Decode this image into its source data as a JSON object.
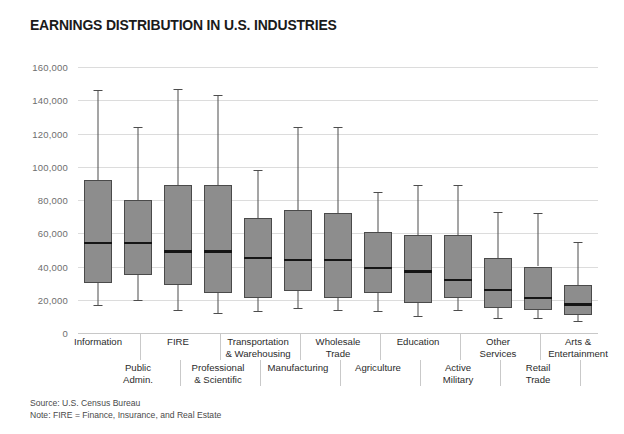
{
  "chart_data": {
    "type": "box",
    "title": "EARNINGS DISTRIBUTION IN U.S. INDUSTRIES",
    "xlabel": "",
    "ylabel": "",
    "ylim": [
      0,
      160000
    ],
    "ytick_values": [
      0,
      20000,
      40000,
      60000,
      80000,
      100000,
      120000,
      140000,
      160000
    ],
    "ytick_labels": [
      "0",
      "20,000",
      "40,000",
      "60,000",
      "80,000",
      "100,000",
      "120,000",
      "140,000",
      "160,000"
    ],
    "grid": true,
    "legend": "none",
    "categories": [
      "Information",
      "Public Admin.",
      "FIRE",
      "Professional & Scientific",
      "Manufacturing",
      "Transportation & Warehousing",
      "Wholesale Trade",
      "Agriculture",
      "Education",
      "Active Military",
      "Other Services",
      "Retail Trade",
      "Arts & Entertainment"
    ],
    "boxes": [
      {
        "category": "Information",
        "whisker_low": 17000,
        "q1": 30000,
        "median": 54000,
        "q3": 92000,
        "whisker_high": 146000
      },
      {
        "category": "Public Admin.",
        "whisker_low": 20000,
        "q1": 35000,
        "median": 54000,
        "q3": 80000,
        "whisker_high": 124000
      },
      {
        "category": "FIRE",
        "whisker_low": 14000,
        "q1": 29000,
        "median": 49000,
        "q3": 89000,
        "whisker_high": 147000
      },
      {
        "category": "Professional & Scientific",
        "whisker_low": 12000,
        "q1": 24000,
        "median": 49000,
        "q3": 89000,
        "whisker_high": 143000
      },
      {
        "category": "Transportation & Warehousing",
        "whisker_low": 13000,
        "q1": 21000,
        "median": 45000,
        "q3": 69000,
        "whisker_high": 98000
      },
      {
        "category": "Manufacturing",
        "whisker_low": 15000,
        "q1": 25000,
        "median": 44000,
        "q3": 74000,
        "whisker_high": 124000
      },
      {
        "category": "Wholesale Trade",
        "whisker_low": 14000,
        "q1": 21000,
        "median": 44000,
        "q3": 72000,
        "whisker_high": 124000
      },
      {
        "category": "Agriculture",
        "whisker_low": 13000,
        "q1": 24000,
        "median": 39000,
        "q3": 61000,
        "whisker_high": 85000
      },
      {
        "category": "Education",
        "whisker_low": 10000,
        "q1": 18000,
        "median": 37000,
        "q3": 59000,
        "whisker_high": 89000
      },
      {
        "category": "Active Military",
        "whisker_low": 14000,
        "q1": 21000,
        "median": 32000,
        "q3": 59000,
        "whisker_high": 89000
      },
      {
        "category": "Other Services",
        "whisker_low": 9000,
        "q1": 15000,
        "median": 26000,
        "q3": 45000,
        "whisker_high": 73000
      },
      {
        "category": "Retail Trade",
        "whisker_low": 9000,
        "q1": 14000,
        "median": 21000,
        "q3": 40000,
        "whisker_high": 72000
      },
      {
        "category": "Arts & Entertainment",
        "whisker_low": 7000,
        "q1": 11000,
        "median": 17000,
        "q3": 29000,
        "whisker_high": 55000
      }
    ],
    "category_label_rows": [
      {
        "text": "Information",
        "row": "top"
      },
      {
        "text": "Public\nAdmin.",
        "row": "bottom"
      },
      {
        "text": "FIRE",
        "row": "top"
      },
      {
        "text": "Professional\n& Scientific",
        "row": "bottom"
      },
      {
        "text": "Transportation\n& Warehousing",
        "row": "top"
      },
      {
        "text": "Manufacturing",
        "row": "bottom"
      },
      {
        "text": "Wholesale\nTrade",
        "row": "top"
      },
      {
        "text": "Agriculture",
        "row": "bottom"
      },
      {
        "text": "Education",
        "row": "top"
      },
      {
        "text": "Active\nMilitary",
        "row": "bottom"
      },
      {
        "text": "Other\nServices",
        "row": "top"
      },
      {
        "text": "Retail\nTrade",
        "row": "bottom"
      },
      {
        "text": "Arts &\nEntertainment",
        "row": "top"
      }
    ],
    "colors": {
      "box_fill": "#8d8d8d",
      "box_stroke": "#4a4a4a",
      "median": "#151515",
      "whisker": "#4d4d4d",
      "gridline": "#dcdcdc",
      "background": "#ffffff",
      "title": "#1a1a1a",
      "tick_text": "#6e6e6e"
    }
  },
  "footnotes": {
    "source": "Source: U.S. Census Bureau",
    "note": "Note: FIRE = Finance, Insurance, and Real Estate"
  }
}
